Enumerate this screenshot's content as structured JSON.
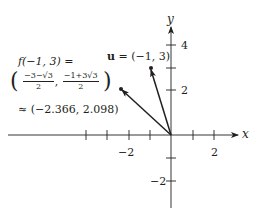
{
  "diagram": {
    "axes": {
      "x_label": "x",
      "y_label": "y",
      "x_ticks": [
        -4,
        -3,
        -2,
        -1,
        1,
        2
      ],
      "x_tick_labels": [
        "−2",
        "2"
      ],
      "y_ticks": [
        -2,
        -1,
        1,
        2,
        3,
        4
      ],
      "y_tick_labels": [
        "4",
        "2",
        "−2"
      ]
    },
    "vectors": [
      {
        "name": "u",
        "x": -1,
        "y": 3
      },
      {
        "name": "f(u)",
        "x": -2.366,
        "y": 2.098
      }
    ],
    "labels": {
      "u_label_bold": "u",
      "u_label_rest": " = (−1, 3)",
      "f_line1": "f(−1, 3) =",
      "frac1_num": "−3−√3",
      "frac1_den": "2",
      "frac2_num": "−1+3√3",
      "frac2_den": "2",
      "approx": "≈ (−2.366, 2.098)",
      "open_paren": "(",
      "close_paren": ")",
      "comma": ","
    },
    "colors": {
      "ink": "#231f20",
      "background": "#ffffff"
    }
  }
}
